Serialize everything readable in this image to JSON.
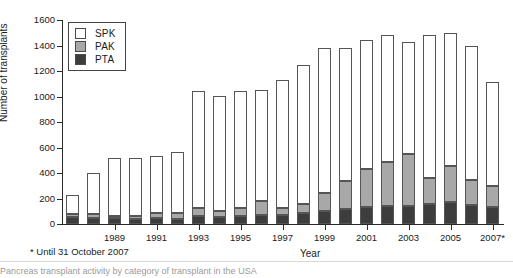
{
  "chart_data": {
    "type": "bar",
    "stacked": true,
    "title": "",
    "xlabel": "Year",
    "ylabel": "Number of transplants",
    "ylim": [
      0,
      1600
    ],
    "ytick_step": 200,
    "yticks": [
      0,
      200,
      400,
      600,
      800,
      1000,
      1200,
      1400,
      1600
    ],
    "grid": false,
    "legend_position": "top-left",
    "categories": [
      "1987",
      "1988",
      "1989",
      "1990",
      "1991",
      "1992",
      "1993",
      "1994",
      "1995",
      "1996",
      "1997",
      "1998",
      "1999",
      "2000",
      "2001",
      "2002",
      "2003",
      "2004",
      "2005",
      "2006",
      "2007*"
    ],
    "xtick_labels": [
      "1989",
      "1991",
      "1993",
      "1995",
      "1997",
      "1999",
      "2001",
      "2003",
      "2005",
      "2007*"
    ],
    "series": [
      {
        "name": "PTA",
        "values": [
          55,
          48,
          45,
          40,
          48,
          38,
          62,
          55,
          60,
          68,
          72,
          90,
          100,
          120,
          130,
          145,
          140,
          155,
          170,
          150,
          135
        ],
        "color": "#3d3d3d"
      },
      {
        "name": "PAK",
        "values": [
          20,
          27,
          20,
          25,
          40,
          45,
          60,
          50,
          65,
          110,
          55,
          65,
          145,
          220,
          305,
          340,
          410,
          205,
          285,
          195,
          165
        ],
        "color": "#a8a8a8"
      },
      {
        "name": "SPK",
        "values": [
          155,
          325,
          455,
          455,
          445,
          485,
          925,
          900,
          920,
          870,
          1000,
          1090,
          1135,
          1040,
          1005,
          1000,
          880,
          1125,
          1045,
          1055,
          815
        ],
        "color": "#ffffff"
      }
    ],
    "totals": [
      230,
      400,
      520,
      520,
      533,
      568,
      1047,
      1005,
      1045,
      1048,
      1127,
      1245,
      1380,
      1380,
      1440,
      1485,
      1430,
      1485,
      1500,
      1400,
      1115
    ],
    "legend_entries": [
      {
        "label": "SPK",
        "color": "#ffffff"
      },
      {
        "label": "PAK",
        "color": "#a8a8a8"
      },
      {
        "label": "PTA",
        "color": "#3d3d3d"
      }
    ],
    "footnote": "* Until 31 October 2007"
  },
  "caption": {
    "number": "",
    "text": "Pancreas transplant activity by category of transplant in the USA"
  }
}
